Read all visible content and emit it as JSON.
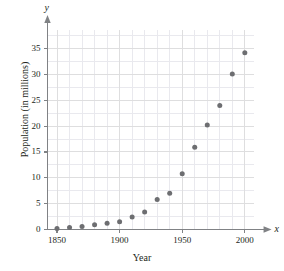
{
  "chart_data": {
    "type": "scatter",
    "title": "",
    "xlabel": "Year",
    "ylabel": "Population (in millions)",
    "x_axis_variable": "x",
    "y_axis_variable": "y",
    "xlim": [
      1840,
      2010
    ],
    "ylim": [
      0,
      39
    ],
    "xticks": [
      1850,
      1900,
      1950,
      2000
    ],
    "yticks": [
      0,
      5,
      10,
      15,
      20,
      25,
      30,
      35
    ],
    "xtick_labels": [
      "1850",
      "1900",
      "1950",
      "2000"
    ],
    "ytick_labels": [
      "0",
      "5",
      "10",
      "15",
      "20",
      "25",
      "30",
      "35"
    ],
    "grid": true,
    "grid_minor_step_x": 10,
    "grid_minor_step_y": 2.5,
    "legend": null,
    "x": [
      1850,
      1860,
      1870,
      1880,
      1890,
      1900,
      1910,
      1920,
      1930,
      1940,
      1950,
      1960,
      1970,
      1980,
      1990,
      2000
    ],
    "values": [
      0.2,
      0.4,
      0.6,
      0.9,
      1.2,
      1.5,
      2.4,
      3.4,
      5.8,
      7.0,
      10.8,
      15.9,
      20.2,
      24.0,
      30.1,
      34.2
    ],
    "marker": "circle",
    "marker_color": "#6d6e71",
    "marker_size_px": 5,
    "grid_color": "#e9e9ee",
    "axis_color": "#808285",
    "text_color": "#231f20"
  }
}
